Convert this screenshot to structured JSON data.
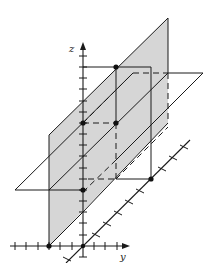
{
  "figure": {
    "type": "3d-coordinate-diagram",
    "axes": {
      "z_label": "z",
      "y_label": "y",
      "x_label": ""
    },
    "colors": {
      "line": "#1a1a1a",
      "plane_shade": "#d6d6d6",
      "background": "#ffffff"
    },
    "planes": [
      {
        "name": "vertical-shaded-plane",
        "shaded": true
      },
      {
        "name": "horizontal-plane",
        "shaded": false
      }
    ],
    "points_marked": 7
  }
}
